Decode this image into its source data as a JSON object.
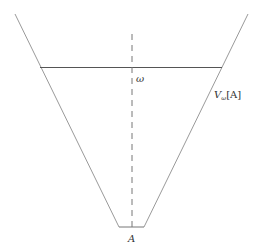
{
  "diagram": {
    "colors": {
      "cone": "#9a9a9a",
      "level_line": "#555555",
      "axis": "#777777",
      "label": "#333333"
    },
    "labels": {
      "omega": "ω",
      "neighborhood_V": "V",
      "neighborhood_sub": "ω",
      "neighborhood_arg": "[A]",
      "base": "A"
    },
    "geometry": {
      "cone_left": {
        "x1": 15,
        "y1": 14,
        "x2": 119,
        "y2": 227
      },
      "cone_right": {
        "x1": 248,
        "y1": 14,
        "x2": 144,
        "y2": 227
      },
      "base_segment": {
        "x1": 119,
        "y1": 227,
        "x2": 144,
        "y2": 227
      },
      "level_line": {
        "x1": 40,
        "y1": 67,
        "x2": 222,
        "y2": 67
      },
      "axis": {
        "x1": 132,
        "y1": 34,
        "x2": 132,
        "y2": 227
      }
    }
  }
}
